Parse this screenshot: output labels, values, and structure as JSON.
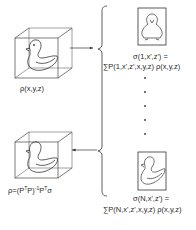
{
  "diagram": {
    "type": "tomographic reconstruction schematic",
    "object": {
      "label": "ρ(x,y,z)",
      "shape": "cube containing a 3D duck"
    },
    "projections": [
      {
        "index": "1",
        "label_line1": "σ(1,x',z') =",
        "label_line2": "∑P(1,x',z',x,y,z) ρ(x,y,z)",
        "view": "front view of duck"
      },
      {
        "index": "N",
        "label_line1": "σ(N,x',z') =",
        "label_line2": "∑P(N,x',z',x,y,z) ρ(x,y,z)",
        "view": "side view of duck"
      }
    ],
    "ellipsis_dots": 5,
    "reconstruction": {
      "label_prefix": "ρ=(P",
      "label_T1": "T",
      "label_mid": "P)",
      "label_inv": "-1",
      "label_P": "P",
      "label_T2": "T",
      "label_sigma": "σ",
      "full_label": "ρ=(PᵀP)⁻¹Pᵀσ"
    },
    "arrows": [
      {
        "from": "object",
        "to": "projections",
        "direction": "right"
      },
      {
        "from": "projections",
        "to": "reconstruction",
        "direction": "left"
      }
    ],
    "colors": {
      "stroke": "#333333",
      "background": "#ffffff"
    }
  }
}
